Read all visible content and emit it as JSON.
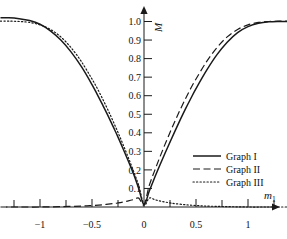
{
  "chart_data": {
    "type": "line",
    "title": "",
    "xlabel": "m_1",
    "xlabel_base": "m",
    "xlabel_sub": "1",
    "ylabel": "M",
    "xlim": [
      -1.38,
      1.38
    ],
    "ylim": [
      -0.06,
      1.08
    ],
    "grid": false,
    "legend_position": "lower-right",
    "x_ticks_major": [
      -1,
      -0.5,
      0,
      0.5,
      1
    ],
    "x_tick_labels": [
      "−1",
      "−0.5",
      "0",
      "0.5",
      "1"
    ],
    "x_ticks_minor": [
      -1.25,
      -0.75,
      -0.25,
      0.25,
      0.75,
      1.25
    ],
    "y_ticks": [
      0.1,
      0.2,
      0.3,
      0.4,
      0.5,
      0.6,
      0.7,
      0.8,
      0.9,
      1.0
    ],
    "y_tick_labels": [
      "0.1",
      "0.2",
      "0.3",
      "0.4",
      "0.5",
      "0.6",
      "0.7",
      "0.8",
      "0.9",
      "1.0"
    ],
    "series": [
      {
        "name": "Graph I",
        "style": "solid",
        "color": "#1a1a1a",
        "x": [
          -1.38,
          -1.3,
          -1.2,
          -1.1,
          -1.0,
          -0.9,
          -0.8,
          -0.7,
          -0.6,
          -0.5,
          -0.45,
          -0.4,
          -0.35,
          -0.3,
          -0.25,
          -0.2,
          -0.15,
          -0.1,
          -0.05,
          0.0,
          0.05,
          0.1,
          0.15,
          0.2,
          0.25,
          0.3,
          0.35,
          0.4,
          0.45,
          0.5,
          0.6,
          0.7,
          0.8,
          0.9,
          1.0,
          1.1,
          1.2,
          1.3,
          1.38
        ],
        "y": [
          1.02,
          1.02,
          1.015,
          1.005,
          0.985,
          0.95,
          0.9,
          0.835,
          0.755,
          0.66,
          0.607,
          0.553,
          0.497,
          0.437,
          0.377,
          0.313,
          0.247,
          0.178,
          0.098,
          0.012,
          0.085,
          0.155,
          0.222,
          0.287,
          0.35,
          0.412,
          0.472,
          0.53,
          0.585,
          0.638,
          0.735,
          0.82,
          0.888,
          0.94,
          0.972,
          0.99,
          0.998,
          1.0,
          1.0
        ]
      },
      {
        "name": "Graph II",
        "style": "dashed",
        "color": "#1a1a1a",
        "x": [
          -1.38,
          -1.2,
          -1.0,
          -0.8,
          -0.6,
          -0.5,
          -0.4,
          -0.3,
          -0.25,
          -0.2,
          -0.15,
          -0.1,
          -0.05,
          0.0,
          0.05,
          0.1,
          0.15,
          0.2,
          0.25,
          0.3,
          0.35,
          0.4,
          0.45,
          0.5,
          0.6,
          0.7,
          0.8,
          0.9,
          1.0,
          1.1,
          1.2,
          1.3,
          1.38
        ],
        "y": [
          0.0,
          0.0,
          0.0,
          0.002,
          0.005,
          0.008,
          0.012,
          0.018,
          0.022,
          0.027,
          0.033,
          0.04,
          0.048,
          0.012,
          0.115,
          0.192,
          0.265,
          0.335,
          0.402,
          0.466,
          0.527,
          0.585,
          0.64,
          0.69,
          0.782,
          0.858,
          0.917,
          0.957,
          0.982,
          0.995,
          1.0,
          1.002,
          1.002
        ]
      },
      {
        "name": "Graph III",
        "style": "dotted",
        "color": "#1a1a1a",
        "x": [
          -1.38,
          -1.3,
          -1.2,
          -1.1,
          -1.0,
          -0.9,
          -0.8,
          -0.7,
          -0.6,
          -0.5,
          -0.45,
          -0.4,
          -0.35,
          -0.3,
          -0.25,
          -0.2,
          -0.15,
          -0.1,
          -0.05,
          0.0,
          0.05,
          0.1,
          0.15,
          0.2,
          0.25,
          0.3,
          0.4,
          0.5,
          0.6,
          0.8,
          1.0,
          1.2,
          1.38
        ],
        "y": [
          1.002,
          1.002,
          1.0,
          0.995,
          0.982,
          0.957,
          0.917,
          0.858,
          0.782,
          0.69,
          0.64,
          0.585,
          0.527,
          0.466,
          0.402,
          0.335,
          0.265,
          0.192,
          0.115,
          0.012,
          0.048,
          0.04,
          0.033,
          0.027,
          0.022,
          0.018,
          0.012,
          0.008,
          0.005,
          0.002,
          0.0,
          0.0,
          0.0
        ]
      }
    ]
  },
  "legend": {
    "items": [
      {
        "label": "Graph I",
        "style": "solid"
      },
      {
        "label": "Graph II",
        "style": "dashed"
      },
      {
        "label": "Graph III",
        "style": "dotted"
      }
    ]
  },
  "axes": {
    "y_axis_name": "M",
    "x_axis_name_base": "m",
    "x_axis_name_sub": "1"
  }
}
